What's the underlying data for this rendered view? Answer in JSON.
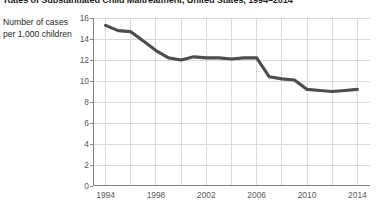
{
  "chart_data": {
    "type": "line",
    "title": "Rates of Substantiated Child Maltreatment, United States, 1994–2014",
    "xlabel": "",
    "ylabel": "Number of cases per 1,000 children",
    "ylabel_line1": "Number of cases",
    "ylabel_line2": "per 1,000 children",
    "xlim": [
      1993,
      2015
    ],
    "ylim": [
      0,
      16
    ],
    "ytick_step": 2,
    "yticks": [
      0,
      2,
      4,
      6,
      8,
      10,
      12,
      14,
      16
    ],
    "ytick_labels": [
      "0",
      "2",
      "4",
      "6",
      "8",
      "10",
      "12",
      "14",
      "16"
    ],
    "xticks": [
      1994,
      1998,
      2002,
      2006,
      2010,
      2014
    ],
    "xtick_labels": [
      "1994",
      "1998",
      "2002",
      "2006",
      "2010",
      "2014"
    ],
    "x_gridlines": [
      1994,
      1996,
      1998,
      2000,
      2002,
      2004,
      2006,
      2008,
      2010,
      2012,
      2014
    ],
    "grid": "both",
    "grid_color": "#d9d9d9",
    "axis_color": "#808285",
    "line_color": "#4d4d4d",
    "line_width": 3.1,
    "legend": "none",
    "series": [
      {
        "name": "Substantiated child maltreatment rate",
        "x": [
          1994,
          1995,
          1996,
          1997,
          1998,
          1999,
          2000,
          2001,
          2002,
          2003,
          2004,
          2005,
          2006,
          2007,
          2008,
          2009,
          2010,
          2011,
          2012,
          2013,
          2014
        ],
        "values": [
          15.3,
          14.8,
          14.7,
          13.8,
          12.9,
          12.2,
          12.0,
          12.3,
          12.2,
          12.2,
          12.1,
          12.2,
          12.2,
          10.4,
          10.2,
          10.1,
          9.2,
          9.1,
          9.0,
          9.1,
          9.2
        ]
      }
    ]
  }
}
